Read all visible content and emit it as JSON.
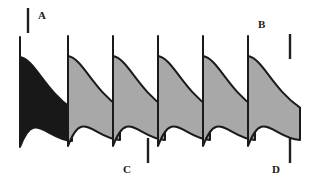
{
  "figure": {
    "width": 327,
    "height": 188,
    "background_color": "#FFFFFF"
  },
  "colors": {
    "blade_fill_gray": "#A8A8A8",
    "blade_fill_dark": "#181818",
    "blade_outline": "#1A1A1A",
    "tick_color": "#1F1F1F",
    "label_color": "#1A1A1A"
  },
  "blades": [
    {
      "index": 0,
      "name": "blade-1-highlighted",
      "fill": "#181818",
      "highlighted": true,
      "leading_edge_x": 20,
      "top_y": 37,
      "bottom_y": 147
    },
    {
      "index": 1,
      "name": "blade-2",
      "fill": "#A8A8A8",
      "highlighted": false,
      "leading_edge_x": 68,
      "top_y": 36,
      "bottom_y": 146
    },
    {
      "index": 2,
      "name": "blade-3",
      "fill": "#A8A8A8",
      "highlighted": false,
      "leading_edge_x": 113,
      "top_y": 36,
      "bottom_y": 146
    },
    {
      "index": 3,
      "name": "blade-4",
      "fill": "#A8A8A8",
      "highlighted": false,
      "leading_edge_x": 158,
      "top_y": 36,
      "bottom_y": 146
    },
    {
      "index": 4,
      "name": "blade-5",
      "fill": "#A8A8A8",
      "highlighted": false,
      "leading_edge_x": 203,
      "top_y": 36,
      "bottom_y": 146
    },
    {
      "index": 5,
      "name": "blade-6",
      "fill": "#A8A8A8",
      "highlighted": false,
      "leading_edge_x": 248,
      "top_y": 36,
      "bottom_y": 146
    }
  ],
  "annotations": [
    {
      "id": "A",
      "label": "A",
      "label_x": 38,
      "label_y": 10,
      "tick": {
        "x": 28,
        "y1": 8,
        "y2": 33
      }
    },
    {
      "id": "B",
      "label": "B",
      "label_x": 258,
      "label_y": 19,
      "tick": {
        "x": 290,
        "y1": 34,
        "y2": 59
      }
    },
    {
      "id": "C",
      "label": "C",
      "label_x": 123,
      "label_y": 164,
      "tick": {
        "x": 148,
        "y1": 138,
        "y2": 163
      }
    },
    {
      "id": "D",
      "label": "D",
      "label_x": 272,
      "label_y": 164,
      "tick": {
        "x": 290,
        "y1": 138,
        "y2": 163
      }
    }
  ],
  "geometry": {
    "blade_pitch": 45,
    "blade_stagger_dx": 26,
    "chord_note": "S-curved camber line, concave-down leading section"
  }
}
